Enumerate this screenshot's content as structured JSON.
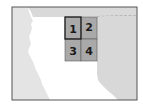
{
  "map": {
    "colors": {
      "background": "#ffffff",
      "land_left": "#e6e6e6",
      "land_top": "#dcdcdc",
      "land_right": "#dadada",
      "plain": "#ffffff",
      "frame": "#555555",
      "grid_fill": "#a9a9a9",
      "grid_line": "#5a5a5a",
      "highlight_border": "#1a1a1a"
    },
    "grid": {
      "cells": [
        {
          "id": 1,
          "label": "1",
          "highlighted": true
        },
        {
          "id": 2,
          "label": "2",
          "highlighted": false
        },
        {
          "id": 3,
          "label": "3",
          "highlighted": false
        },
        {
          "id": 4,
          "label": "4",
          "highlighted": false
        }
      ]
    }
  }
}
